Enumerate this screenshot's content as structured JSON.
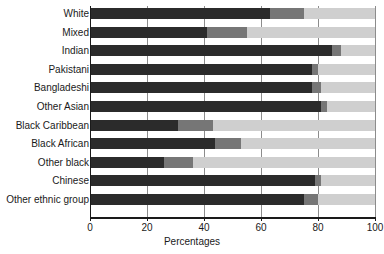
{
  "chart_data": {
    "type": "bar",
    "orientation": "horizontal",
    "stacked": true,
    "title": "",
    "xlabel": "Percentages",
    "ylabel": "",
    "xlim": [
      0,
      100
    ],
    "xticks": [
      0,
      20,
      40,
      60,
      80,
      100
    ],
    "xtick_labels": [
      "0",
      "20",
      "40",
      "60",
      "80",
      "100"
    ],
    "grid": true,
    "grid_axis": "x",
    "legend": "none",
    "categories": [
      "White",
      "Mixed",
      "Indian",
      "Pakistani",
      "Bangladeshi",
      "Other Asian",
      "Black Caribbean",
      "Black African",
      "Other black",
      "Chinese",
      "Other ethnic group"
    ],
    "series": [
      {
        "name": "segment-1",
        "color": "#2b2b2b",
        "values": [
          63,
          41,
          85,
          78,
          78,
          81,
          31,
          44,
          26,
          79,
          75
        ]
      },
      {
        "name": "segment-2",
        "color": "#767676",
        "values": [
          12,
          14,
          3,
          2,
          3,
          2,
          12,
          9,
          10,
          2,
          5
        ]
      },
      {
        "name": "segment-3",
        "color": "#cfcfcf",
        "values": [
          25,
          45,
          12,
          20,
          19,
          17,
          57,
          47,
          64,
          19,
          20
        ]
      }
    ]
  }
}
